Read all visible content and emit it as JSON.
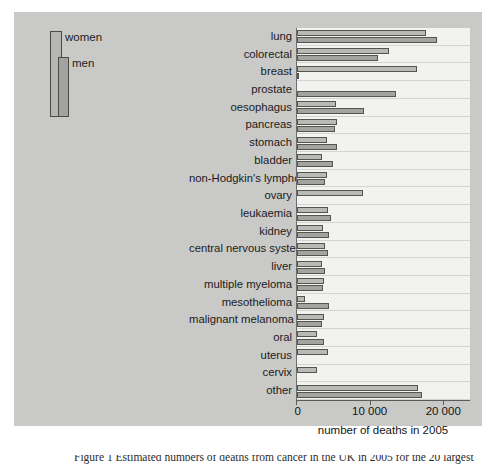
{
  "legend": {
    "items": [
      {
        "label": "women",
        "color": "#b9b9b6"
      },
      {
        "label": "men",
        "color": "#a3a3a0"
      }
    ]
  },
  "axis": {
    "x_title": "number of deaths in 2005",
    "ticks": [
      "0",
      "10 000",
      "20 000"
    ]
  },
  "caption": {
    "text": "Figure 1  Estimated numbers of deaths from cancer in the UK in 2005 for the 20 largest"
  },
  "chart_data": {
    "type": "bar",
    "orientation": "horizontal",
    "title": "",
    "xlabel": "number of deaths in 2005",
    "ylabel": "",
    "xlim": [
      0,
      23500
    ],
    "xticks": [
      0,
      10000,
      20000
    ],
    "xtick_labels": [
      "0",
      "10 000",
      "20 000"
    ],
    "grid": true,
    "legend_position": "top-left-outside",
    "categories": [
      "lung",
      "colorectal",
      "breast",
      "prostate",
      "oesophagus",
      "pancreas",
      "stomach",
      "bladder",
      "non-Hodgkin's lymphoma",
      "ovary",
      "leukaemia",
      "kidney",
      "central nervous system",
      "liver",
      "multiple myeloma",
      "mesothelioma",
      "malignant melanoma",
      "oral",
      "uterus",
      "cervix",
      "other"
    ],
    "series": [
      {
        "name": "men",
        "color": "#a3a3a0",
        "values": [
          15000,
          8900,
          100,
          10000,
          7000,
          3700,
          3800,
          3100,
          2400,
          0,
          2400,
          2300,
          1900,
          1500,
          1100,
          1700,
          1000,
          1100,
          0,
          0,
          10300
        ]
      },
      {
        "name": "women",
        "color": "#b9b9b6",
        "values": [
          11900,
          7800,
          11800,
          0,
          4000,
          3900,
          2000,
          1500,
          2000,
          6800,
          1900,
          1400,
          1500,
          1400,
          1000,
          300,
          900,
          600,
          1700,
          1000,
          11000
        ]
      }
    ]
  },
  "bars": [
    {
      "category": "lung",
      "women_px": 129,
      "men_px": 140
    },
    {
      "category": "colorectal",
      "women_px": 92,
      "men_px": 81
    },
    {
      "category": "breast",
      "women_px": 120,
      "men_px": 2
    },
    {
      "category": "prostate",
      "women_px": 0,
      "men_px": 99
    },
    {
      "category": "oesophagus",
      "women_px": 39,
      "men_px": 67
    },
    {
      "category": "pancreas",
      "women_px": 40,
      "men_px": 38
    },
    {
      "category": "stomach",
      "women_px": 30,
      "men_px": 40
    },
    {
      "category": "bladder",
      "women_px": 25,
      "men_px": 36
    },
    {
      "category": "non-Hodgkin's lymphoma",
      "women_px": 30,
      "men_px": 28
    },
    {
      "category": "ovary",
      "women_px": 66,
      "men_px": 0
    },
    {
      "category": "leukaemia",
      "women_px": 31,
      "men_px": 34
    },
    {
      "category": "kidney",
      "women_px": 26,
      "men_px": 32
    },
    {
      "category": "central nervous system",
      "women_px": 28,
      "men_px": 31
    },
    {
      "category": "liver",
      "women_px": 25,
      "men_px": 28
    },
    {
      "category": "multiple myeloma",
      "women_px": 27,
      "men_px": 26
    },
    {
      "category": "mesothelioma",
      "women_px": 8,
      "men_px": 32
    },
    {
      "category": "malignant melanoma",
      "women_px": 27,
      "men_px": 25
    },
    {
      "category": "oral",
      "women_px": 20,
      "men_px": 27
    },
    {
      "category": "uterus",
      "women_px": 31,
      "men_px": 0
    },
    {
      "category": "cervix",
      "women_px": 20,
      "men_px": 0
    },
    {
      "category": "other",
      "women_px": 121,
      "men_px": 125
    }
  ]
}
